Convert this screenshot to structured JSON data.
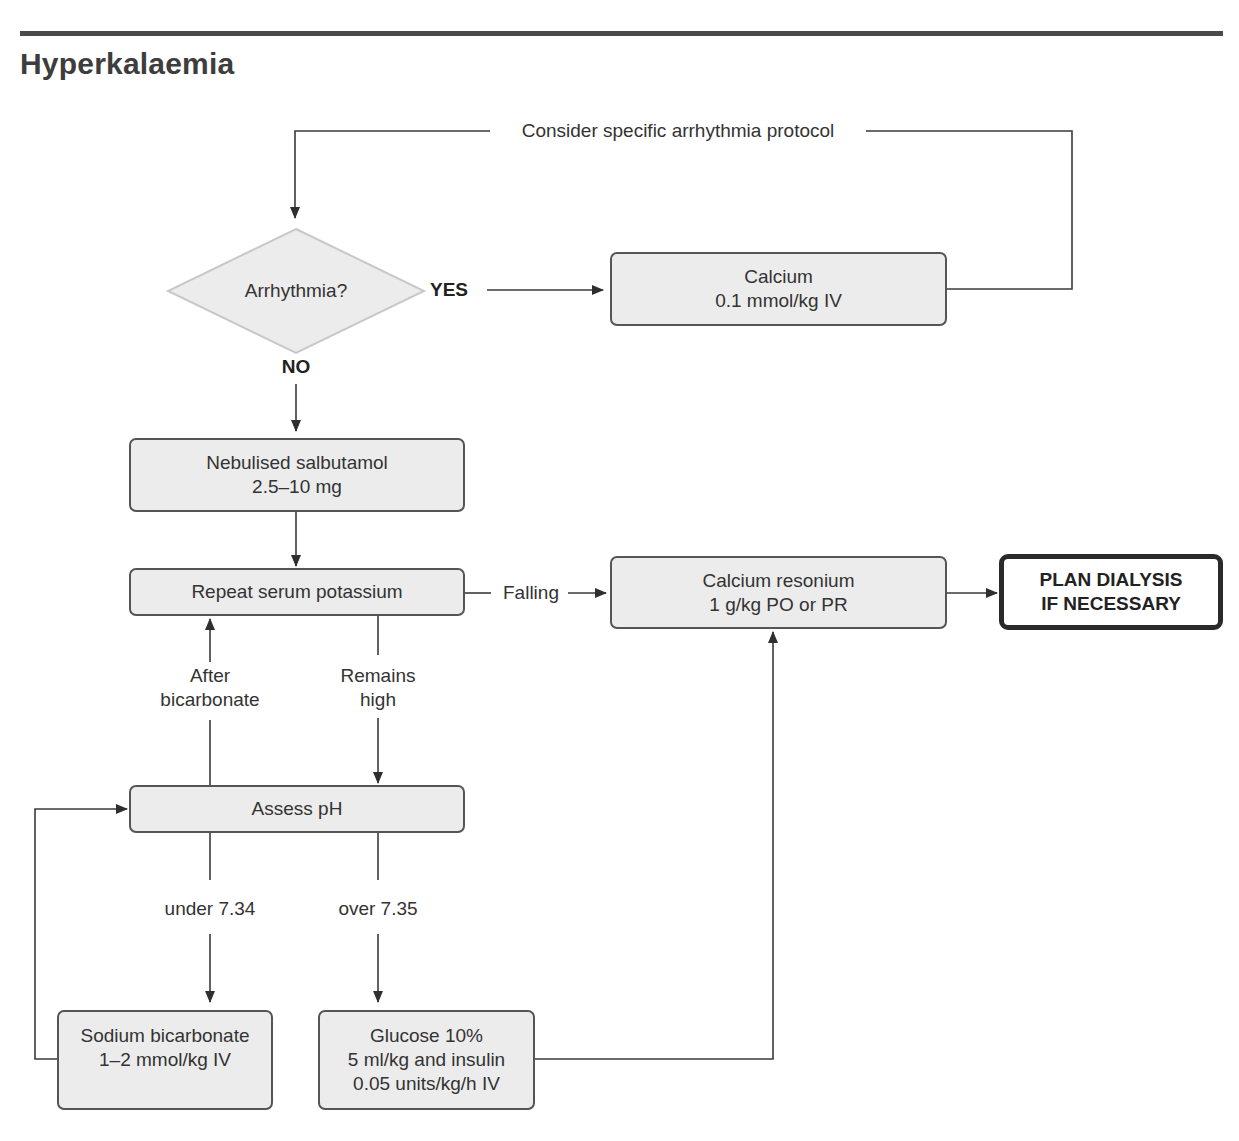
{
  "page": {
    "title": "Hyperkalaemia"
  },
  "nodes": {
    "decision_arrhythmia": {
      "label": "Arrhythmia?"
    },
    "calcium": {
      "line1": "Calcium",
      "line2": "0.1 mmol/kg IV"
    },
    "salbutamol": {
      "line1": "Nebulised salbutamol",
      "line2": "2.5–10 mg"
    },
    "repeat_potassium": {
      "line1": "Repeat serum potassium"
    },
    "calcium_resonium": {
      "line1": "Calcium resonium",
      "line2": "1 g/kg PO or PR"
    },
    "plan_dialysis": {
      "line1": "PLAN DIALYSIS",
      "line2": "IF NECESSARY"
    },
    "assess_ph": {
      "line1": "Assess pH"
    },
    "sodium_bicarbonate": {
      "line1": "Sodium bicarbonate",
      "line2": "1–2 mmol/kg IV"
    },
    "glucose_insulin": {
      "line1": "Glucose 10%",
      "line2": "5 ml/kg and insulin",
      "line3": "0.05 units/kg/h IV"
    }
  },
  "edges": {
    "arrhythmia_protocol": {
      "label": "Consider specific arrhythmia protocol"
    },
    "yes": {
      "label": "YES"
    },
    "no": {
      "label": "NO"
    },
    "falling": {
      "label": "Falling"
    },
    "after_bicarbonate": {
      "line1": "After",
      "line2": "bicarbonate"
    },
    "remains_high": {
      "line1": "Remains",
      "line2": "high"
    },
    "under": {
      "label": "under 7.34"
    },
    "over": {
      "label": "over 7.35"
    }
  },
  "colors": {
    "box_fill": "#ececec",
    "box_border": "#555555",
    "line": "#3a3a3a",
    "diamond_border": "#c8c8c8",
    "diamond_fill": "#ececec",
    "terminal_border": "#2a2a2a"
  }
}
